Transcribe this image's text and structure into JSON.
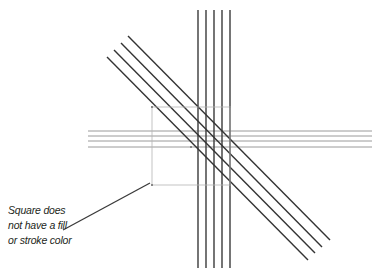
{
  "annotation": {
    "lines": [
      "Square does",
      "not have a fill",
      "or stroke color"
    ]
  },
  "colors": {
    "background": "#ffffff",
    "vertical_lines": "#3a3a3a",
    "diagonal_lines": "#333333",
    "horizontal_lines": "#9a9a9a",
    "square_outline": "#b5b5b5",
    "leader_line": "#3a3a3a",
    "text": "#231f20"
  },
  "diagram": {
    "vertical_lines": {
      "x": [
        198,
        206,
        214,
        222,
        230
      ],
      "y1": 10,
      "y2": 268
    },
    "horizontal_lines": {
      "y": [
        131,
        136,
        141,
        147
      ],
      "x1": 88,
      "x2": 372
    },
    "diagonal_lines": [
      {
        "x1": 128,
        "y1": 36,
        "x2": 330,
        "y2": 240
      },
      {
        "x1": 121,
        "y1": 43,
        "x2": 322,
        "y2": 247
      },
      {
        "x1": 114,
        "y1": 50,
        "x2": 315,
        "y2": 253
      },
      {
        "x1": 107,
        "y1": 57,
        "x2": 308,
        "y2": 260
      }
    ],
    "square": {
      "x": 152,
      "y": 107,
      "width": 78,
      "height": 78,
      "center": [
        191,
        147
      ]
    },
    "leader_line": {
      "x1": 63,
      "y1": 230,
      "x2": 150,
      "y2": 183
    }
  }
}
